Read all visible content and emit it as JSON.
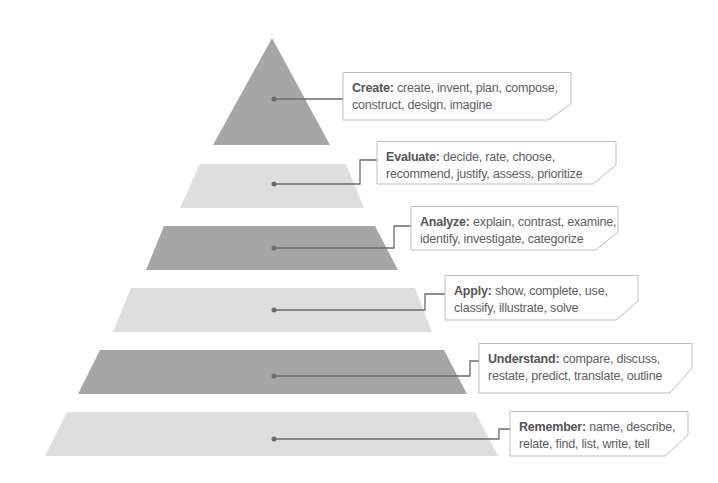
{
  "diagram": {
    "type": "pyramid",
    "colors": {
      "dark_band": "#a6a6a6",
      "light_band": "#dedede",
      "connector": "#6b6b6b",
      "box_border": "#bdbdbd",
      "text": "#5e5e5e"
    },
    "levels": [
      {
        "name": "Create",
        "title": "Create:",
        "line1_rest": " create, invent, plan, compose,",
        "line2": "construct, design, imagine",
        "shade": "dark"
      },
      {
        "name": "Evaluate",
        "title": "Evaluate:",
        "line1_rest": " decide, rate, choose,",
        "line2": "recommend, justify, assess, prioritize",
        "shade": "light"
      },
      {
        "name": "Analyze",
        "title": "Analyze:",
        "line1_rest": " explain, contrast, examine,",
        "line2": "identify, investigate, categorize",
        "shade": "dark"
      },
      {
        "name": "Apply",
        "title": "Apply:",
        "line1_rest": " show, complete, use,",
        "line2": "classify, illustrate, solve",
        "shade": "light"
      },
      {
        "name": "Understand",
        "title": "Understand:",
        "line1_rest": " compare, discuss,",
        "line2": "restate, predict, translate, outline",
        "shade": "dark"
      },
      {
        "name": "Remember",
        "title": "Remember:",
        "line1_rest": " name, describe,",
        "line2": "relate, find, list, write, tell",
        "shade": "light"
      }
    ]
  }
}
